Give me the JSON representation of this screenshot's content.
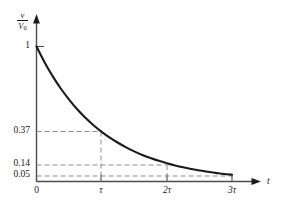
{
  "figure": {
    "background_color": "#ffffff",
    "curve_color": "#1a1a1a",
    "axis_color": "#4d4d4d",
    "dashed_color": "#808080"
  },
  "axes": {
    "y_axis_label_numerator": "v",
    "y_axis_label_denominator": "V",
    "y_axis_label_denominator_sub": "0",
    "x_axis_label": "t"
  },
  "y_ticks": [
    {
      "label": "1",
      "value": 1.0
    },
    {
      "label": "0.37",
      "value": 0.37
    },
    {
      "label": "0.14",
      "value": 0.14
    },
    {
      "label": "0.05",
      "value": 0.05
    }
  ],
  "x_ticks": [
    {
      "label": "0",
      "value": 0
    },
    {
      "label": "τ",
      "value": 1
    },
    {
      "label": "2τ",
      "value": 2
    },
    {
      "label": "3τ",
      "value": 3
    }
  ],
  "chart_data": {
    "type": "line",
    "title": "",
    "subtitle": "",
    "xlabel": "t",
    "ylabel": "v/V0",
    "xlim": [
      0,
      3.4
    ],
    "ylim": [
      0,
      1.08
    ],
    "grid": false,
    "legend": null,
    "x_tick_labels": [
      "0",
      "τ",
      "2τ",
      "3τ"
    ],
    "x_tick_values": [
      0,
      1,
      2,
      3
    ],
    "y_tick_labels": [
      "1",
      "0.37",
      "0.14",
      "0.05"
    ],
    "y_tick_values": [
      1.0,
      0.37,
      0.14,
      0.05
    ],
    "series": [
      {
        "name": "v/V0 = exp(-t/tau)",
        "x": [
          0,
          0.125,
          0.25,
          0.375,
          0.5,
          0.625,
          0.75,
          0.875,
          1,
          1.125,
          1.25,
          1.375,
          1.5,
          1.625,
          1.75,
          1.875,
          2,
          2.125,
          2.25,
          2.375,
          2.5,
          2.625,
          2.75,
          2.875,
          3
        ],
        "y": [
          1.0,
          0.882,
          0.779,
          0.687,
          0.607,
          0.535,
          0.472,
          0.417,
          0.368,
          0.325,
          0.287,
          0.253,
          0.223,
          0.197,
          0.174,
          0.153,
          0.135,
          0.119,
          0.105,
          0.093,
          0.082,
          0.072,
          0.064,
          0.056,
          0.05
        ]
      }
    ],
    "annotations": [
      {
        "text": "1",
        "x": 0,
        "y": 1.0,
        "kind": "y-tick-marker"
      },
      {
        "text": "0.37",
        "x": 1,
        "y": 0.37,
        "kind": "dashed-guide"
      },
      {
        "text": "0.14",
        "x": 2,
        "y": 0.14,
        "kind": "dashed-guide"
      },
      {
        "text": "0.05",
        "x": 3,
        "y": 0.05,
        "kind": "dashed-guide"
      }
    ]
  }
}
